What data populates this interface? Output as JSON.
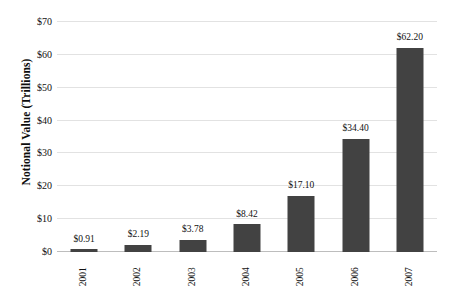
{
  "chart_data": {
    "type": "bar",
    "title": "",
    "subtitle": "",
    "xlabel": "",
    "ylabel": "Notional Value (Trillions)",
    "categories": [
      "2001",
      "2002",
      "2003",
      "2004",
      "2005",
      "2006",
      "2007"
    ],
    "values": [
      0.91,
      2.19,
      3.78,
      8.42,
      17.1,
      34.4,
      62.2
    ],
    "data_labels": [
      "$0.91",
      "$2.19",
      "$3.78",
      "$8.42",
      "$17.10",
      "$34.40",
      "$62.20"
    ],
    "ylim": [
      0,
      70
    ],
    "ytick_values": [
      0,
      10,
      20,
      30,
      40,
      50,
      60,
      70
    ],
    "ytick_labels": [
      "$0",
      "$10",
      "$20",
      "$30",
      "$40",
      "$50",
      "$60",
      "$70"
    ],
    "grid": true,
    "legend": null,
    "legend_position": "none",
    "series": [
      {
        "name": "Notional Value",
        "values": [
          0.91,
          2.19,
          3.78,
          8.42,
          17.1,
          34.4,
          62.2
        ]
      }
    ]
  },
  "style": {
    "bar_color": "#424242",
    "gridline_color": "#e2e2e2",
    "baseline_color": "#bdbdbd",
    "background_color": "#ffffff",
    "text_color": "#111111"
  }
}
